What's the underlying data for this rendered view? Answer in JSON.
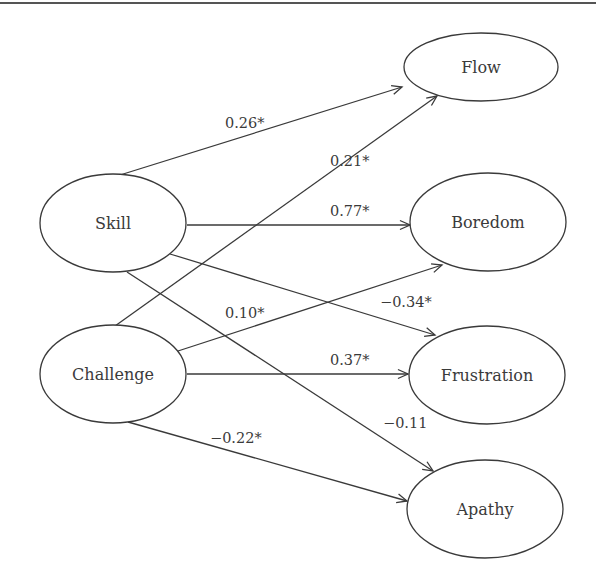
{
  "diagram": {
    "type": "path-model",
    "nodes": [
      {
        "id": "skill",
        "label": "Skill",
        "cx": 113,
        "cy": 223,
        "rx": 73,
        "ry": 49
      },
      {
        "id": "challenge",
        "label": "Challenge",
        "cx": 113,
        "cy": 374,
        "rx": 73,
        "ry": 49
      },
      {
        "id": "flow",
        "label": "Flow",
        "cx": 481,
        "cy": 67,
        "rx": 77,
        "ry": 34
      },
      {
        "id": "boredom",
        "label": "Boredom",
        "cx": 488,
        "cy": 222,
        "rx": 78,
        "ry": 49
      },
      {
        "id": "frustration",
        "label": "Frustration",
        "cx": 487,
        "cy": 375,
        "rx": 78,
        "ry": 49
      },
      {
        "id": "apathy",
        "label": "Apathy",
        "cx": 485,
        "cy": 509,
        "rx": 78,
        "ry": 49
      }
    ],
    "edges": [
      {
        "from": "skill",
        "to": "flow",
        "label": "0.26*",
        "x1": 120,
        "y1": 175,
        "x2": 402,
        "y2": 87,
        "lx": 225,
        "ly": 128
      },
      {
        "from": "challenge",
        "to": "flow",
        "label": "0.21*",
        "x1": 115,
        "y1": 326,
        "x2": 437,
        "y2": 96,
        "lx": 330,
        "ly": 166
      },
      {
        "from": "skill",
        "to": "boredom",
        "label": "0.77*",
        "x1": 187,
        "y1": 225,
        "x2": 410,
        "y2": 225,
        "lx": 330,
        "ly": 216
      },
      {
        "from": "skill",
        "to": "frustration",
        "label": "−0.34*",
        "x1": 170,
        "y1": 254,
        "x2": 435,
        "y2": 335,
        "lx": 380,
        "ly": 307
      },
      {
        "from": "skill",
        "to": "apathy",
        "label": "−0.11",
        "x1": 127,
        "y1": 272,
        "x2": 433,
        "y2": 471,
        "lx": 383,
        "ly": 428
      },
      {
        "from": "challenge",
        "to": "boredom",
        "label": "0.10*",
        "x1": 178,
        "y1": 351,
        "x2": 442,
        "y2": 265,
        "lx": 225,
        "ly": 318
      },
      {
        "from": "challenge",
        "to": "frustration",
        "label": "0.37*",
        "x1": 187,
        "y1": 374,
        "x2": 408,
        "y2": 374,
        "lx": 330,
        "ly": 365
      },
      {
        "from": "challenge",
        "to": "apathy",
        "label": "−0.22*",
        "x1": 128,
        "y1": 422,
        "x2": 407,
        "y2": 501,
        "lx": 210,
        "ly": 443
      }
    ]
  }
}
